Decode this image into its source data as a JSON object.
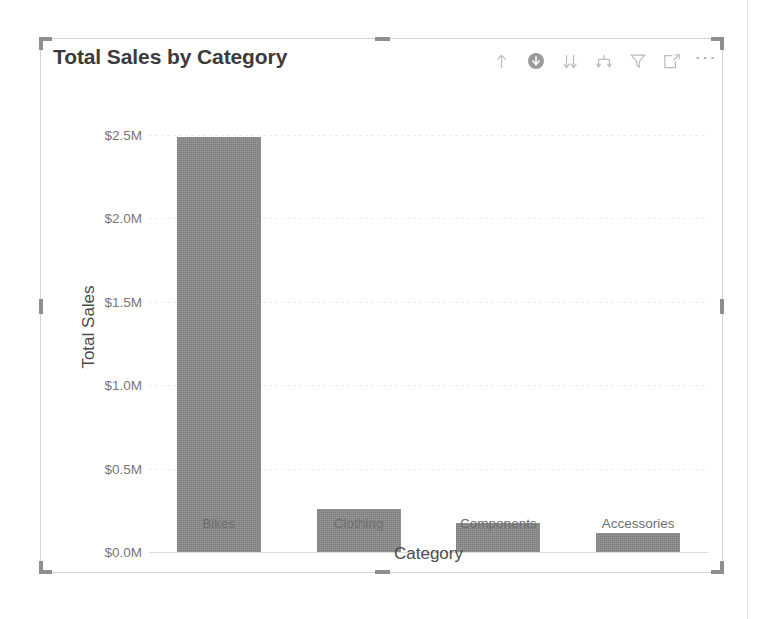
{
  "visual": {
    "title": "Total Sales by Category",
    "selected": true
  },
  "toolbar": {
    "items": [
      {
        "name": "drill-up-icon",
        "label": "Drill up",
        "glyph": "arrow-up"
      },
      {
        "name": "drill-down-toggle-icon",
        "label": "Drill down",
        "glyph": "circle-arrow-down"
      },
      {
        "name": "expand-all-icon",
        "label": "Go to the next level in the hierarchy",
        "glyph": "double-arrow-down"
      },
      {
        "name": "expand-hierarchy-icon",
        "label": "Expand all down one level in the hierarchy",
        "glyph": "split-arrow-down"
      },
      {
        "name": "filter-icon",
        "label": "Filters",
        "glyph": "funnel"
      },
      {
        "name": "focus-mode-icon",
        "label": "Focus mode",
        "glyph": "expand-frame"
      },
      {
        "name": "more-options-icon",
        "label": "More options",
        "glyph": "ellipsis"
      }
    ],
    "ellipsis": "···"
  },
  "chart_data": {
    "type": "bar",
    "title": "Total Sales by Category",
    "xlabel": "Category",
    "ylabel": "Total Sales",
    "categories": [
      "Bikes",
      "Clothing",
      "Components",
      "Accessories"
    ],
    "values": [
      2490000,
      260000,
      175000,
      115000
    ],
    "value_labels": [
      "$2.49M",
      "$0.26M",
      "$0.18M",
      "$0.12M"
    ],
    "ylim": [
      0,
      2500000
    ],
    "yticks": [
      0,
      500000,
      1000000,
      1500000,
      2000000,
      2500000
    ],
    "ytick_labels": [
      "$0.0M",
      "$0.5M",
      "$1.0M",
      "$1.5M",
      "$2.0M",
      "$2.5M"
    ],
    "grid": true,
    "legend": null,
    "bar_color": "#8b8b8b",
    "orientation": "vertical"
  },
  "colors": {
    "bar": "#8b8b8b",
    "title_text": "#3b3b3b",
    "axis_title": "#4a4a4a",
    "tick_text": "#777777",
    "gridline": "#ededed",
    "frame_border": "#d3d3d3",
    "handle": "#8f8f8f",
    "panel_divider": "#e2e2e2"
  }
}
